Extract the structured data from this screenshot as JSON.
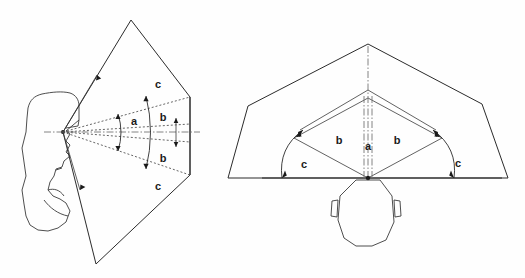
{
  "figure": {
    "background_color": "#fefefe",
    "line_color": "#2b2b2b",
    "width": 525,
    "height": 278
  },
  "labels": {
    "zone_a": "a",
    "zone_b": "b",
    "zone_c": "c"
  },
  "side_view": {
    "name": "side-view-diagram",
    "description": "Profile of a head facing right with nested visual field zones projected forward",
    "zone_labels": [
      {
        "text": "c",
        "x": 158,
        "y": 88
      },
      {
        "text": "b",
        "x": 163,
        "y": 121
      },
      {
        "text": "a",
        "x": 134,
        "y": 125
      },
      {
        "text": "b",
        "x": 163,
        "y": 162
      },
      {
        "text": "c",
        "x": 158,
        "y": 190
      }
    ],
    "apex": {
      "x": 63,
      "y": 132
    },
    "outer_quad": [
      {
        "x": 63,
        "y": 132
      },
      {
        "x": 131,
        "y": 20
      },
      {
        "x": 190,
        "y": 97
      },
      {
        "x": 190,
        "y": 175
      },
      {
        "x": 96,
        "y": 264
      }
    ],
    "right_edge_x": 190,
    "centerline_y": 132
  },
  "top_view": {
    "name": "top-view-diagram",
    "description": "Overhead view of a head with nested visual field zones fanning outward",
    "zone_labels": [
      {
        "text": "c",
        "x": 304,
        "y": 168
      },
      {
        "text": "b",
        "x": 339,
        "y": 144
      },
      {
        "text": "a",
        "x": 368,
        "y": 150
      },
      {
        "text": "b",
        "x": 397,
        "y": 144
      },
      {
        "text": "c",
        "x": 458,
        "y": 167
      }
    ],
    "apex": {
      "x": 368,
      "y": 178
    },
    "outer_apex": {
      "x": 368,
      "y": 44
    },
    "baseline_y": 178,
    "baseline_x_start": 262,
    "baseline_x_end": 502,
    "left_vertex": {
      "x": 228,
      "y": 178
    },
    "right_vertex": {
      "x": 508,
      "y": 178
    }
  }
}
